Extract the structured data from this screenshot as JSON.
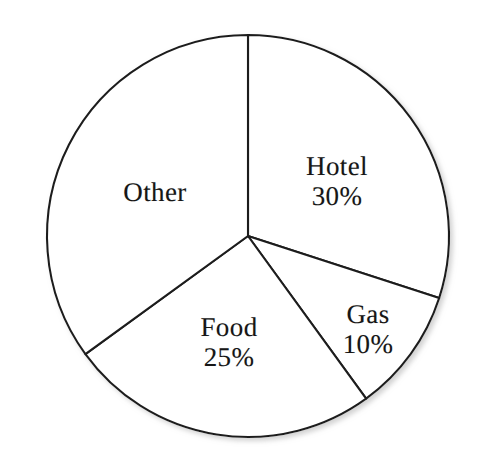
{
  "chart_data": {
    "type": "pie",
    "title": "",
    "subtitle": "",
    "xlabel": "",
    "ylabel": "",
    "legend": "none",
    "grid": false,
    "units": "percent",
    "start_angle_deg": -90,
    "direction": "clockwise",
    "categories": [
      "Hotel",
      "Gas",
      "Food",
      "Other"
    ],
    "values": [
      30,
      10,
      25,
      35
    ],
    "slices": [
      {
        "label": "Hotel",
        "value": 30,
        "value_text": "30%",
        "show_value": true,
        "sweep_deg": 108,
        "start_deg": -90,
        "end_deg": 18,
        "label_x": 337,
        "label_y": 181
      },
      {
        "label": "Gas",
        "value": 10,
        "value_text": "10%",
        "show_value": true,
        "sweep_deg": 36,
        "start_deg": 18,
        "end_deg": 54,
        "label_x": 368,
        "label_y": 329
      },
      {
        "label": "Food",
        "value": 25,
        "value_text": "25%",
        "show_value": true,
        "sweep_deg": 90,
        "start_deg": 54,
        "end_deg": 144,
        "label_x": 229,
        "label_y": 342
      },
      {
        "label": "Other",
        "value": 35,
        "value_text": "",
        "show_value": false,
        "sweep_deg": 126,
        "start_deg": 144,
        "end_deg": 270,
        "label_x": 155,
        "label_y": 192
      }
    ],
    "geometry": {
      "center_x": 248,
      "center_y": 236,
      "radius": 201
    },
    "colors": {
      "slice_fill": "#ffffff",
      "outline": "#1f1f1f",
      "label_text": "#161616",
      "background": "#ffffff"
    }
  }
}
